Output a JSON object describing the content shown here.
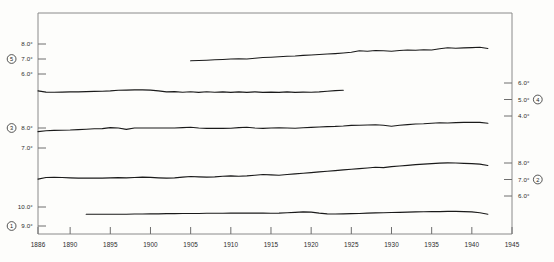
{
  "chart_data": {
    "type": "line",
    "title": "",
    "subtitle": "",
    "xlabel": "",
    "ylabel": "",
    "grid": false,
    "legend_position": "axis-badges",
    "xlim": [
      1886,
      1945
    ],
    "x_tick_labels": [
      "1886",
      "1890",
      "1895",
      "1900",
      "1905",
      "1910",
      "1915",
      "1920",
      "1925",
      "1930",
      "1935",
      "1940",
      "1945"
    ],
    "x_ticks": [
      1886,
      1890,
      1895,
      1900,
      1905,
      1910,
      1915,
      1920,
      1925,
      1930,
      1935,
      1940,
      1945
    ],
    "left_axis_ticks": [
      {
        "label": "8.0°",
        "series": "5",
        "badge": false
      },
      {
        "label": "7.0°",
        "series": "5",
        "badge": true
      },
      {
        "label": "6.0°",
        "series": "5",
        "badge": false
      },
      {
        "label": "8.0°",
        "series": "3",
        "badge": true
      },
      {
        "label": "7.0°",
        "series": "3",
        "badge": false
      },
      {
        "label": "10.0°",
        "series": "1",
        "badge": false
      },
      {
        "label": "9.0°",
        "series": "1",
        "badge": true
      }
    ],
    "right_axis_ticks": [
      {
        "label": "6.0°",
        "series": "4",
        "badge": false
      },
      {
        "label": "5.0°",
        "series": "4",
        "badge": true
      },
      {
        "label": "4.0°",
        "series": "4",
        "badge": false
      },
      {
        "label": "8.0°",
        "series": "2",
        "badge": false
      },
      {
        "label": "7.0°",
        "series": "2",
        "badge": true
      },
      {
        "label": "6.0°",
        "series": "2",
        "badge": false
      }
    ],
    "series": [
      {
        "name": "5",
        "badge_label": "5",
        "axis": "left",
        "axis_group": "top-left",
        "x": [
          1905,
          1906,
          1907,
          1908,
          1909,
          1910,
          1911,
          1912,
          1913,
          1914,
          1915,
          1916,
          1917,
          1918,
          1919,
          1920,
          1921,
          1922,
          1923,
          1924,
          1925,
          1926,
          1927,
          1928,
          1929,
          1930,
          1931,
          1932,
          1933,
          1934,
          1935,
          1936,
          1937,
          1938,
          1939,
          1940,
          1941,
          1942
        ],
        "values": [
          6.88,
          6.9,
          6.92,
          6.95,
          6.97,
          7.0,
          7.02,
          7.0,
          7.05,
          7.1,
          7.12,
          7.15,
          7.18,
          7.2,
          7.24,
          7.27,
          7.3,
          7.33,
          7.36,
          7.4,
          7.45,
          7.55,
          7.52,
          7.57,
          7.55,
          7.52,
          7.57,
          7.6,
          7.58,
          7.62,
          7.6,
          7.68,
          7.75,
          7.72,
          7.74,
          7.76,
          7.78,
          7.7
        ]
      },
      {
        "name": "4",
        "badge_label": "4",
        "axis": "right",
        "axis_group": "upper-right",
        "x": [
          1886,
          1887,
          1888,
          1889,
          1890,
          1891,
          1892,
          1893,
          1894,
          1895,
          1896,
          1897,
          1898,
          1899,
          1900,
          1901,
          1902,
          1903,
          1904,
          1905,
          1906,
          1907,
          1908,
          1909,
          1910,
          1911,
          1912,
          1913,
          1914,
          1915,
          1916,
          1917,
          1918,
          1919,
          1920,
          1921,
          1922,
          1923,
          1924
        ],
        "values": [
          5.52,
          5.45,
          5.44,
          5.45,
          5.46,
          5.46,
          5.48,
          5.49,
          5.5,
          5.52,
          5.56,
          5.57,
          5.58,
          5.58,
          5.57,
          5.52,
          5.46,
          5.48,
          5.44,
          5.47,
          5.43,
          5.47,
          5.44,
          5.46,
          5.43,
          5.46,
          5.43,
          5.46,
          5.43,
          5.45,
          5.43,
          5.46,
          5.43,
          5.45,
          5.44,
          5.46,
          5.5,
          5.54,
          5.56
        ]
      },
      {
        "name": "3",
        "badge_label": "3",
        "axis": "left",
        "axis_group": "mid-left",
        "x": [
          1886,
          1887,
          1888,
          1889,
          1890,
          1891,
          1892,
          1893,
          1894,
          1895,
          1896,
          1897,
          1898,
          1899,
          1900,
          1901,
          1902,
          1903,
          1904,
          1905,
          1906,
          1907,
          1908,
          1909,
          1910,
          1911,
          1912,
          1913,
          1914,
          1915,
          1916,
          1917,
          1918,
          1919,
          1920,
          1921,
          1922,
          1923,
          1924,
          1925,
          1926,
          1927,
          1928,
          1929,
          1930,
          1931,
          1932,
          1933,
          1934,
          1935,
          1936,
          1937,
          1938,
          1939,
          1940,
          1941,
          1942
        ],
        "values": [
          7.82,
          7.86,
          7.88,
          7.89,
          7.9,
          7.92,
          7.94,
          7.96,
          7.97,
          8.02,
          8.0,
          7.93,
          8.0,
          8.0,
          8.0,
          8.0,
          8.0,
          8.0,
          8.02,
          8.04,
          8.0,
          7.98,
          7.98,
          7.98,
          7.99,
          8.02,
          8.04,
          8.0,
          7.98,
          8.0,
          8.01,
          8.0,
          7.99,
          8.01,
          8.03,
          8.05,
          8.07,
          8.08,
          8.1,
          8.13,
          8.14,
          8.15,
          8.16,
          8.14,
          8.09,
          8.14,
          8.17,
          8.2,
          8.21,
          8.24,
          8.26,
          8.25,
          8.27,
          8.28,
          8.29,
          8.28,
          8.24
        ]
      },
      {
        "name": "2",
        "badge_label": "2",
        "axis": "right",
        "axis_group": "lower-right",
        "x": [
          1886,
          1887,
          1888,
          1889,
          1890,
          1891,
          1892,
          1893,
          1894,
          1895,
          1896,
          1897,
          1898,
          1899,
          1900,
          1901,
          1902,
          1903,
          1904,
          1905,
          1906,
          1907,
          1908,
          1909,
          1910,
          1911,
          1912,
          1913,
          1914,
          1915,
          1916,
          1917,
          1918,
          1919,
          1920,
          1921,
          1922,
          1923,
          1924,
          1925,
          1926,
          1927,
          1928,
          1929,
          1930,
          1931,
          1932,
          1933,
          1934,
          1935,
          1936,
          1937,
          1938,
          1939,
          1940,
          1941,
          1942
        ],
        "values": [
          7.02,
          7.12,
          7.13,
          7.12,
          7.1,
          7.08,
          7.08,
          7.09,
          7.08,
          7.1,
          7.11,
          7.1,
          7.12,
          7.14,
          7.13,
          7.1,
          7.08,
          7.1,
          7.14,
          7.18,
          7.16,
          7.14,
          7.16,
          7.2,
          7.22,
          7.2,
          7.22,
          7.26,
          7.3,
          7.28,
          7.26,
          7.3,
          7.34,
          7.38,
          7.42,
          7.46,
          7.5,
          7.54,
          7.58,
          7.62,
          7.66,
          7.7,
          7.74,
          7.72,
          7.78,
          7.82,
          7.86,
          7.9,
          7.93,
          7.96,
          7.99,
          8.01,
          8.0,
          7.98,
          7.96,
          7.93,
          7.85
        ]
      },
      {
        "name": "1",
        "badge_label": "1",
        "axis": "left",
        "axis_group": "bottom-left",
        "x": [
          1892,
          1893,
          1894,
          1895,
          1896,
          1897,
          1898,
          1899,
          1900,
          1901,
          1902,
          1903,
          1904,
          1905,
          1906,
          1907,
          1908,
          1909,
          1910,
          1911,
          1912,
          1913,
          1914,
          1915,
          1916,
          1917,
          1918,
          1919,
          1920,
          1921,
          1922,
          1923,
          1924,
          1925,
          1926,
          1927,
          1928,
          1929,
          1930,
          1931,
          1932,
          1933,
          1934,
          1935,
          1936,
          1937,
          1938,
          1939,
          1940,
          1941,
          1942
        ],
        "values": [
          9.62,
          9.62,
          9.62,
          9.62,
          9.62,
          9.62,
          9.63,
          9.63,
          9.64,
          9.64,
          9.65,
          9.65,
          9.66,
          9.66,
          9.66,
          9.67,
          9.67,
          9.67,
          9.68,
          9.68,
          9.68,
          9.68,
          9.68,
          9.67,
          9.68,
          9.7,
          9.72,
          9.74,
          9.73,
          9.68,
          9.64,
          9.63,
          9.64,
          9.65,
          9.66,
          9.68,
          9.69,
          9.7,
          9.71,
          9.72,
          9.73,
          9.74,
          9.75,
          9.76,
          9.76,
          9.77,
          9.77,
          9.76,
          9.74,
          9.7,
          9.62
        ]
      }
    ]
  }
}
